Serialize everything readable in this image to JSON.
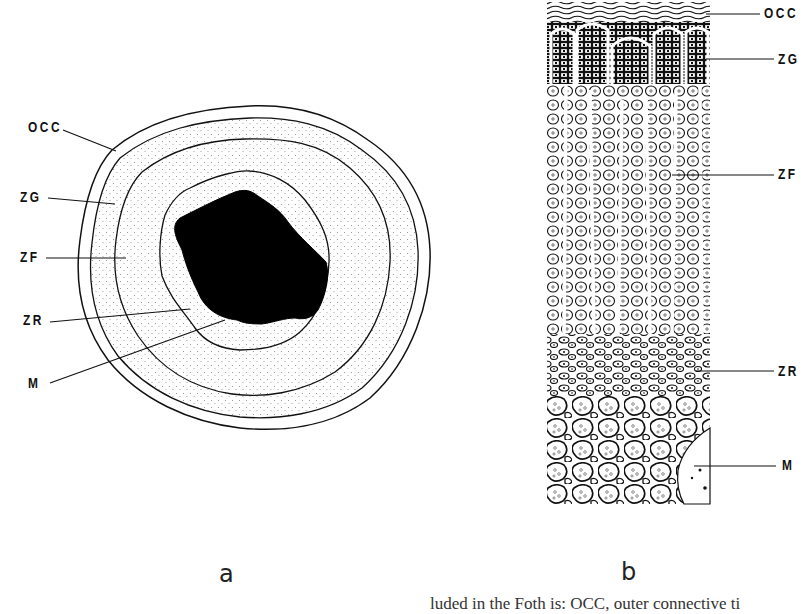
{
  "figure": {
    "panels": [
      {
        "id": "a",
        "letter": "a",
        "description": "Cross-section of adrenal gland showing concentric zones",
        "labels": [
          "OCC",
          "ZG",
          "ZF",
          "ZR",
          "M"
        ]
      },
      {
        "id": "b",
        "letter": "b",
        "description": "Histological column through adrenal cortex and medulla",
        "labels": [
          "OCC",
          "ZG",
          "ZF",
          "ZR",
          "M"
        ]
      }
    ],
    "caption_partial": "luded in the Foth  is: OCC, outer connective ti"
  },
  "colors": {
    "ink": "#111111",
    "background": "#ffffff",
    "stipple": "#8a8a8a"
  }
}
